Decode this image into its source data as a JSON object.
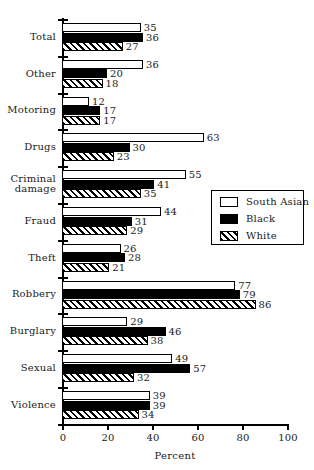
{
  "chart_data": {
    "type": "bar",
    "orientation": "horizontal",
    "title": "",
    "xlabel": "Percent",
    "ylabel": "",
    "xlim": [
      0,
      100
    ],
    "xticks": [
      0,
      20,
      40,
      60,
      80,
      100
    ],
    "grid": false,
    "legend_position": "middle-right",
    "categories": [
      "Total",
      "Other",
      "Motoring",
      "Drugs",
      "Criminal\ndamage",
      "Fraud",
      "Theft",
      "Robbery",
      "Burglary",
      "Sexual",
      "Violence"
    ],
    "series": [
      {
        "name": "South Asian",
        "fill": "open",
        "values": [
          35,
          36,
          12,
          63,
          55,
          44,
          26,
          77,
          29,
          49,
          39
        ]
      },
      {
        "name": "Black",
        "fill": "solid",
        "values": [
          36,
          20,
          17,
          30,
          41,
          31,
          28,
          79,
          46,
          57,
          39
        ]
      },
      {
        "name": "White",
        "fill": "hatch",
        "values": [
          27,
          18,
          17,
          23,
          35,
          29,
          21,
          86,
          38,
          32,
          34
        ]
      }
    ]
  },
  "legend": {
    "entries": [
      {
        "label": "South Asian",
        "swatch": "open-square-icon"
      },
      {
        "label": "Black",
        "swatch": "filled-square-icon"
      },
      {
        "label": "White",
        "swatch": "hatched-square-icon"
      }
    ]
  }
}
